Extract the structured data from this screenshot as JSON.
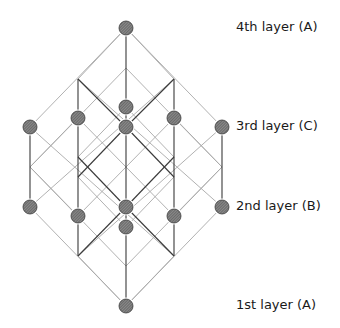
{
  "figure": {
    "type": "stacking-lattice",
    "colors": {
      "background": "#ffffff",
      "light_line": "#a8a8a8",
      "dark_line": "#3a3a3a",
      "atom_fill": "#6e6e6e",
      "atom_stroke": "#3a3a3a",
      "text": "#1a1a1a"
    },
    "atom_radius": 7
  },
  "layers": [
    {
      "id": "layer-4",
      "label": "4th layer (A)",
      "label_x": 236,
      "label_y": 19
    },
    {
      "id": "layer-3",
      "label": "3rd layer (C)",
      "label_x": 236,
      "label_y": 118
    },
    {
      "id": "layer-2",
      "label": "2nd layer (B)",
      "label_x": 236,
      "label_y": 198
    },
    {
      "id": "layer-1",
      "label": "1st layer (A)",
      "label_x": 236,
      "label_y": 297
    }
  ],
  "atoms": [
    {
      "x": 126,
      "y": 28,
      "layer": "4th"
    },
    {
      "x": 30,
      "y": 127,
      "layer": "3rd"
    },
    {
      "x": 78,
      "y": 118,
      "layer": "3rd"
    },
    {
      "x": 126,
      "y": 107,
      "layer": "3rd"
    },
    {
      "x": 126,
      "y": 127,
      "layer": "3rd"
    },
    {
      "x": 174,
      "y": 118,
      "layer": "3rd"
    },
    {
      "x": 222,
      "y": 127,
      "layer": "3rd"
    },
    {
      "x": 30,
      "y": 207,
      "layer": "2nd"
    },
    {
      "x": 78,
      "y": 216,
      "layer": "2nd"
    },
    {
      "x": 126,
      "y": 207,
      "layer": "2nd"
    },
    {
      "x": 126,
      "y": 227,
      "layer": "2nd"
    },
    {
      "x": 174,
      "y": 216,
      "layer": "2nd"
    },
    {
      "x": 222,
      "y": 207,
      "layer": "2nd"
    },
    {
      "x": 126,
      "y": 306,
      "layer": "1st"
    }
  ],
  "light_lines": [
    [
      126,
      28,
      30,
      127
    ],
    [
      126,
      28,
      222,
      127
    ],
    [
      30,
      207,
      126,
      306
    ],
    [
      222,
      207,
      126,
      306
    ],
    [
      126,
      68,
      30,
      167
    ],
    [
      126,
      68,
      222,
      167
    ],
    [
      30,
      167,
      126,
      266
    ],
    [
      222,
      167,
      126,
      266
    ],
    [
      78,
      79,
      222,
      207
    ],
    [
      174,
      79,
      30,
      207
    ],
    [
      30,
      127,
      174,
      256
    ],
    [
      222,
      127,
      78,
      256
    ],
    [
      78,
      118,
      174,
      216
    ],
    [
      174,
      118,
      78,
      216
    ],
    [
      30,
      167,
      78,
      118
    ],
    [
      222,
      167,
      174,
      118
    ],
    [
      30,
      167,
      78,
      216
    ],
    [
      222,
      167,
      174,
      216
    ],
    [
      78,
      157,
      126,
      107
    ],
    [
      174,
      157,
      126,
      107
    ],
    [
      78,
      177,
      126,
      227
    ],
    [
      174,
      177,
      126,
      227
    ],
    [
      78,
      79,
      126,
      28
    ],
    [
      174,
      79,
      126,
      28
    ],
    [
      78,
      256,
      126,
      306
    ],
    [
      174,
      256,
      126,
      306
    ]
  ],
  "dark_lines": [
    [
      126,
      28,
      126,
      127
    ],
    [
      126,
      207,
      126,
      306
    ],
    [
      126,
      127,
      126,
      207
    ],
    [
      30,
      127,
      30,
      207
    ],
    [
      222,
      127,
      222,
      207
    ],
    [
      78,
      79,
      78,
      256
    ],
    [
      174,
      79,
      174,
      256
    ],
    [
      78,
      79,
      126,
      127
    ],
    [
      174,
      79,
      126,
      127
    ],
    [
      78,
      177,
      126,
      127
    ],
    [
      174,
      177,
      126,
      127
    ],
    [
      78,
      157,
      126,
      207
    ],
    [
      174,
      157,
      126,
      207
    ],
    [
      78,
      256,
      126,
      207
    ],
    [
      174,
      256,
      126,
      207
    ]
  ]
}
